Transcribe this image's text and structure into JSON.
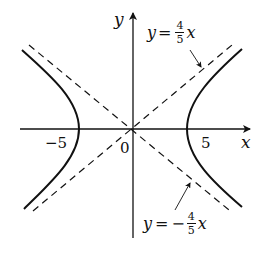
{
  "diagram": {
    "type": "hyperbola-with-asymptotes",
    "axes": {
      "x_label": "x",
      "y_label": "y",
      "origin_label": "0"
    },
    "ticks": {
      "left_vertex": "−5",
      "right_vertex": "5"
    },
    "asymptotes": [
      {
        "lhs": "y",
        "eq": "=",
        "sign": "",
        "num": "4",
        "den": "5",
        "var": "x"
      },
      {
        "lhs": "y",
        "eq": "=",
        "sign": "−",
        "num": "4",
        "den": "5",
        "var": "x"
      }
    ],
    "colors": {
      "ink": "#111111",
      "background": "#ffffff"
    }
  }
}
